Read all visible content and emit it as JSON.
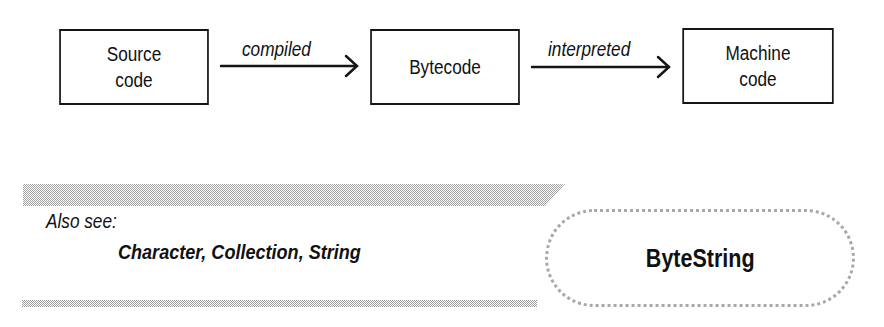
{
  "diagram": {
    "nodes": [
      {
        "id": "source",
        "lines": [
          "Source",
          "code"
        ]
      },
      {
        "id": "bytecode",
        "lines": [
          "Bytecode"
        ]
      },
      {
        "id": "machine",
        "lines": [
          "Machine",
          "code"
        ]
      }
    ],
    "edges": [
      {
        "from": "source",
        "to": "bytecode",
        "label": "compiled"
      },
      {
        "from": "bytecode",
        "to": "machine",
        "label": "interpreted"
      }
    ]
  },
  "also_see": {
    "label": "Also see:",
    "links": [
      "Character",
      "Collection",
      "String"
    ],
    "separator": ", "
  },
  "topic": {
    "title": "ByteString"
  },
  "colors": {
    "stroke": "#151515",
    "dither": "#a8a8a8",
    "background": "#ffffff"
  }
}
